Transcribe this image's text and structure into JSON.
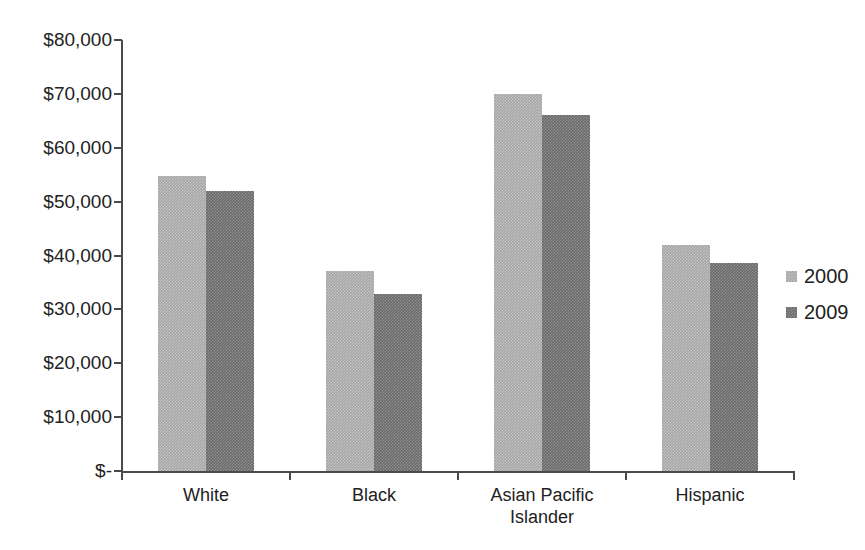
{
  "chart_data": {
    "type": "bar",
    "title": "",
    "subtitle": "",
    "xlabel": "",
    "ylabel": "",
    "categories": [
      "White",
      "Black",
      "Asian Pacific\nIslander",
      "Hispanic"
    ],
    "series": [
      {
        "name": "2000",
        "color": "#a6a6a6",
        "values": [
          54700,
          37200,
          70000,
          42000
        ]
      },
      {
        "name": "2009",
        "color": "#6b6b6b",
        "values": [
          52000,
          32800,
          66000,
          38700
        ]
      }
    ],
    "ylim": [
      0,
      80000
    ],
    "ytick_values": [
      80000,
      70000,
      60000,
      50000,
      40000,
      30000,
      20000,
      10000,
      0
    ],
    "ytick_labels": [
      "$80,000",
      "$70,000",
      "$60,000",
      "$50,000",
      "$40,000",
      "$30,000",
      "$20,000",
      "$10,000",
      "$-"
    ],
    "grid": false,
    "legend_position": "right",
    "legend_entries": [
      "2000",
      "2009"
    ],
    "axis_color": "#4a4a4a",
    "text_color": "#222222",
    "background": "#ffffff"
  }
}
